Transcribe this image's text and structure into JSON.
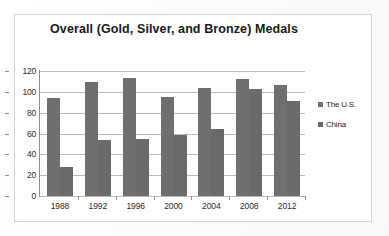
{
  "chart_data": {
    "type": "bar",
    "title": "Overall (Gold, Silver, and Bronze) Medals",
    "xlabel": "",
    "ylabel": "",
    "categories": [
      "1988",
      "1992",
      "1996",
      "2000",
      "2004",
      "2008",
      "2012"
    ],
    "series": [
      {
        "name": "The U.S.",
        "values": [
          94,
          109,
          113,
          95,
          104,
          112,
          107
        ],
        "color": "#6f6f6f"
      },
      {
        "name": "China",
        "values": [
          28,
          54,
          55,
          59,
          64,
          103,
          91
        ],
        "color": "#6a6a6a"
      }
    ],
    "ylim": [
      0,
      120
    ],
    "y_ticks": [
      "0",
      "20",
      "40",
      "60",
      "80",
      "100",
      "120"
    ],
    "grid": true,
    "legend_position": "right"
  },
  "legend": {
    "items": [
      {
        "label": "The U.S."
      },
      {
        "label": "China"
      }
    ]
  }
}
